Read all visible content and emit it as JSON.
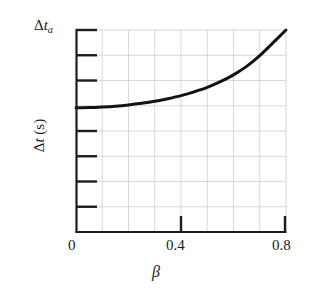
{
  "figure": {
    "background_color": "#ffffff",
    "ink_color": "#1c1c1c",
    "grid_color": "#cfcfcf",
    "curve_color": "#131313"
  },
  "labels": {
    "y_top_delta": "Δ",
    "y_top_var": "t",
    "y_top_sub": "a",
    "y_axis_title_delta": "Δ",
    "y_axis_title_var": "t",
    "y_axis_title_unit": " (s)",
    "x_axis_title": "β"
  },
  "axes": {
    "x_tick_labels": [
      "0",
      "0.4",
      "0.8"
    ],
    "x_tick_values": [
      0,
      0.4,
      0.8
    ],
    "y_tick_labels": [
      "Δtₐ",
      "",
      "",
      "",
      "",
      "",
      "",
      ""
    ]
  },
  "chart_data": {
    "type": "line",
    "title": "",
    "subtitle": "",
    "xlabel": "β",
    "ylabel": "Δt (s)",
    "xlim": [
      0,
      0.8
    ],
    "ylim": [
      0,
      1
    ],
    "grid": true,
    "grid_x_divisions": 8,
    "grid_y_divisions": 8,
    "legend": "none",
    "x_ticks": [
      0,
      0.4,
      0.8
    ],
    "x_tick_labels": [
      "0",
      "0.4",
      "0.8"
    ],
    "y_ticks": [
      0.125,
      0.25,
      0.375,
      0.5,
      0.625,
      0.75,
      0.875,
      1.0
    ],
    "y_tick_labels": [
      "",
      "",
      "",
      "",
      "",
      "",
      "",
      "Δtₐ"
    ],
    "y_top_label": "Δtₐ",
    "annotations": [],
    "series": [
      {
        "name": "Δt vs β",
        "description": "Relativistic time interval rising with speed parameter beta, flat near beta=0 and steeply increasing toward beta=0.8 where it reaches Δtₐ",
        "line_width_px": 3,
        "color": "#131313",
        "x": [
          0.0,
          0.05,
          0.1,
          0.15,
          0.2,
          0.25,
          0.3,
          0.35,
          0.4,
          0.45,
          0.5,
          0.55,
          0.6,
          0.65,
          0.7,
          0.75,
          0.8
        ],
        "y": [
          0.615,
          0.616,
          0.619,
          0.623,
          0.629,
          0.637,
          0.647,
          0.66,
          0.675,
          0.694,
          0.716,
          0.744,
          0.778,
          0.82,
          0.873,
          0.936,
          1.0
        ]
      }
    ]
  }
}
